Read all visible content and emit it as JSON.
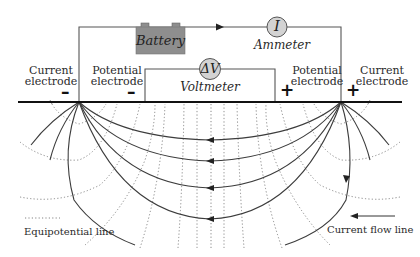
{
  "diagram": {
    "type": "electrical resistivity survey (four-electrode array)",
    "colors": {
      "wire": "#4a4a4a",
      "ground_line": "#111111",
      "battery_fill": "#8e8e8e",
      "meter_fill": "#d3d3d3",
      "flow_line": "#3c3c3c",
      "equipotential_line": "#777777"
    },
    "circuit": {
      "battery_label": "Battery",
      "ammeter_symbol": "I",
      "ammeter_label": "Ammeter",
      "voltmeter_symbol": "ΔV",
      "voltmeter_label": "Voltmeter"
    },
    "electrodes": {
      "left_current": {
        "label_line1": "Current",
        "label_line2": "electrode",
        "polarity": "–"
      },
      "left_potential": {
        "label_line1": "Potential",
        "label_line2": "electrode",
        "polarity": "–"
      },
      "right_potential": {
        "label_line1": "Potential",
        "label_line2": "electrode",
        "polarity": "+"
      },
      "right_current": {
        "label_line1": "Current",
        "label_line2": "electrode",
        "polarity": "+"
      }
    },
    "legend": {
      "equipotential": "Equipotential line",
      "current_flow": "Current flow line"
    }
  }
}
